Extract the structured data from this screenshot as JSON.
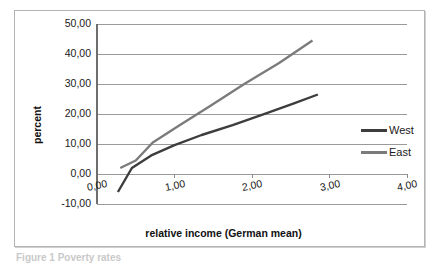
{
  "figure": {
    "caption_fragment": "Figure 1  Poverty rates"
  },
  "legend": {
    "position": "right",
    "items": [
      {
        "label": "West",
        "color": "#3d3d3d"
      },
      {
        "label": "East",
        "color": "#7b7b7b"
      }
    ]
  },
  "chart_data": {
    "type": "line",
    "title": "",
    "subtitle": "",
    "xlabel": "relative income (German mean)",
    "ylabel": "percent",
    "xlim": [
      0,
      4
    ],
    "ylim": [
      -10,
      50
    ],
    "xticks": [
      "0,00",
      "1,00",
      "2,00",
      "3,00",
      "4,00"
    ],
    "xtick_values": [
      0,
      1,
      2,
      3,
      4
    ],
    "yticks": [
      "-10,00",
      "0,00",
      "10,00",
      "20,00",
      "30,00",
      "40,00",
      "50,00"
    ],
    "ytick_values": [
      -10,
      0,
      10,
      20,
      30,
      40,
      50
    ],
    "grid": "horizontal",
    "legend_position": "right",
    "decimal_separator": ",",
    "series": [
      {
        "name": "West",
        "color": "#3d3d3d",
        "x": [
          0.27,
          0.45,
          0.7,
          1.0,
          1.35,
          1.75,
          2.2,
          2.55,
          2.85
        ],
        "values": [
          -6.0,
          2.0,
          6.2,
          9.6,
          13.0,
          16.3,
          20.4,
          23.6,
          26.5
        ]
      },
      {
        "name": "East",
        "color": "#7b7b7b",
        "x": [
          0.3,
          0.5,
          0.72,
          1.05,
          1.45,
          1.9,
          2.35,
          2.78
        ],
        "values": [
          2.0,
          4.5,
          10.5,
          16.0,
          22.5,
          30.0,
          37.0,
          44.5
        ]
      }
    ]
  }
}
